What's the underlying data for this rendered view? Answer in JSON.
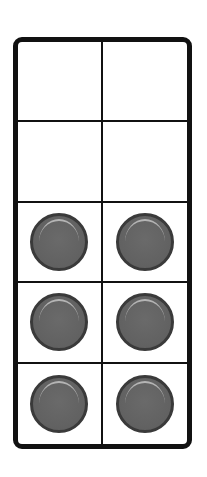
{
  "ten_frame": {
    "rows": 5,
    "columns": 2,
    "filled_count": 6,
    "empty_count": 4,
    "counter_color": "#616161",
    "cells": [
      [
        false,
        false
      ],
      [
        false,
        false
      ],
      [
        true,
        true
      ],
      [
        true,
        true
      ],
      [
        true,
        true
      ]
    ]
  }
}
